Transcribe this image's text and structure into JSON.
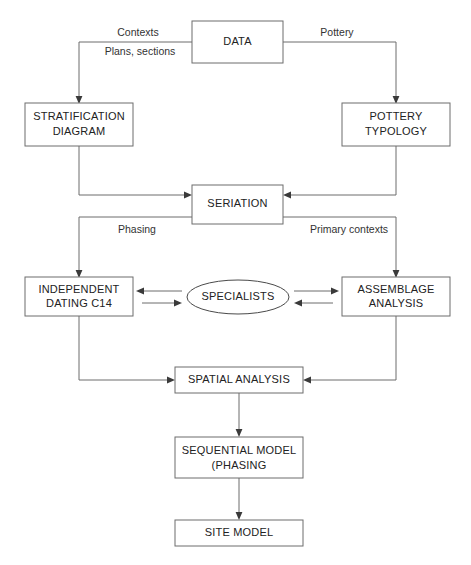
{
  "diagram": {
    "canvas": {
      "width": 471,
      "height": 565
    },
    "colors": {
      "background": "#ffffff",
      "box_stroke": "#6d6d6d",
      "ellipse_stroke": "#4a4a4a",
      "line": "#6d6d6d",
      "arrow_head": "#3a3a3a",
      "text": "#222222"
    },
    "nodes": [
      {
        "id": "data",
        "shape": "rect",
        "label": "DATA",
        "lines": [
          "DATA"
        ]
      },
      {
        "id": "stratification",
        "shape": "rect",
        "label": "STRATIFICATION DIAGRAM",
        "lines": [
          "STRATIFICATION",
          "DIAGRAM"
        ]
      },
      {
        "id": "pottery",
        "shape": "rect",
        "label": "POTTERY TYPOLOGY",
        "lines": [
          "POTTERY",
          "TYPOLOGY"
        ]
      },
      {
        "id": "seriation",
        "shape": "rect",
        "label": "SERIATION",
        "lines": [
          "SERIATION"
        ]
      },
      {
        "id": "dating",
        "shape": "rect",
        "label": "INDEPENDENT DATING C14",
        "lines": [
          "INDEPENDENT",
          "DATING C14"
        ]
      },
      {
        "id": "specialists",
        "shape": "ellipse",
        "label": "SPECIALISTS",
        "lines": [
          "SPECIALISTS"
        ]
      },
      {
        "id": "assemblage",
        "shape": "rect",
        "label": "ASSEMBLAGE ANALYSIS",
        "lines": [
          "ASSEMBLAGE",
          "ANALYSIS"
        ]
      },
      {
        "id": "spatial",
        "shape": "rect",
        "label": "SPATIAL ANALYSIS",
        "lines": [
          "SPATIAL ANALYSIS"
        ]
      },
      {
        "id": "sequential",
        "shape": "rect",
        "label": "SEQUENTIAL MODEL (PHASING",
        "lines": [
          "SEQUENTIAL MODEL",
          "(PHASING"
        ]
      },
      {
        "id": "site",
        "shape": "rect",
        "label": "SITE MODEL",
        "lines": [
          "SITE MODEL"
        ]
      }
    ],
    "edge_labels": [
      {
        "id": "contexts",
        "text": "Contexts"
      },
      {
        "id": "plans-sections",
        "text": "Plans, sections"
      },
      {
        "id": "pottery-label",
        "text": "Pottery"
      },
      {
        "id": "phasing",
        "text": "Phasing"
      },
      {
        "id": "primary-contexts",
        "text": "Primary contexts"
      }
    ],
    "edges": [
      {
        "from": "data",
        "to": "stratification",
        "label": "Contexts / Plans, sections",
        "directed": true
      },
      {
        "from": "data",
        "to": "pottery",
        "label": "Pottery",
        "directed": true
      },
      {
        "from": "stratification",
        "to": "seriation",
        "label": "",
        "directed": true
      },
      {
        "from": "pottery",
        "to": "seriation",
        "label": "",
        "directed": true
      },
      {
        "from": "seriation",
        "to": "dating",
        "label": "Phasing",
        "directed": true
      },
      {
        "from": "seriation",
        "to": "assemblage",
        "label": "Primary contexts",
        "directed": true
      },
      {
        "from": "specialists",
        "to": "dating",
        "label": "",
        "directed": true
      },
      {
        "from": "dating",
        "to": "specialists",
        "label": "",
        "directed": true
      },
      {
        "from": "specialists",
        "to": "assemblage",
        "label": "",
        "directed": true
      },
      {
        "from": "assemblage",
        "to": "specialists",
        "label": "",
        "directed": true
      },
      {
        "from": "dating",
        "to": "spatial",
        "label": "",
        "directed": true
      },
      {
        "from": "assemblage",
        "to": "spatial",
        "label": "",
        "directed": true
      },
      {
        "from": "spatial",
        "to": "sequential",
        "label": "",
        "directed": true
      },
      {
        "from": "sequential",
        "to": "site",
        "label": "",
        "directed": true
      }
    ]
  }
}
